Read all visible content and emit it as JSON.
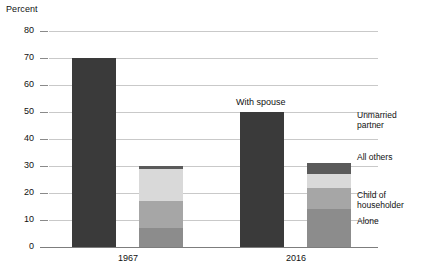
{
  "chart_data": {
    "type": "bar",
    "title": "",
    "subtitle": "",
    "ylabel": "Percent",
    "xlabel": "",
    "ylim": [
      0,
      80
    ],
    "ytick_values": [
      0,
      10,
      20,
      30,
      40,
      50,
      60,
      70,
      80
    ],
    "ytick_labels": [
      "0",
      "10",
      "20",
      "30",
      "40",
      "50",
      "60",
      "70",
      "80"
    ],
    "grid": true,
    "legend_position": "right-of-2016-stack",
    "categories": [
      "1967",
      "2016"
    ],
    "annotations": [
      {
        "text": "With spouse",
        "attached_to": "2016 with-spouse bar"
      }
    ],
    "series": [
      {
        "name": "With spouse",
        "color": "#3a3a3a",
        "values": [
          70,
          50
        ]
      },
      {
        "name": "Alone",
        "color": "#8c8c8c",
        "values": [
          7,
          14
        ]
      },
      {
        "name": "Child of householder",
        "color": "#a6a6a6",
        "values": [
          10,
          8
        ]
      },
      {
        "name": "All others",
        "color": "#d9d9d9",
        "values": [
          12,
          5
        ]
      },
      {
        "name": "Unmarried partner",
        "color": "#5a5a5a",
        "values": [
          1,
          4
        ]
      }
    ],
    "stack_totals": [
      30,
      31
    ]
  },
  "axis": {
    "y_title": "Percent",
    "ticks": [
      "80",
      "70",
      "60",
      "50",
      "40",
      "30",
      "20",
      "10",
      "0"
    ],
    "x_labels": [
      "1967",
      "2016"
    ]
  },
  "annotation": {
    "with_spouse": "With spouse"
  },
  "legend": {
    "items": [
      {
        "label": "Unmarried\npartner",
        "color": "#5a5a5a"
      },
      {
        "label": "All others",
        "color": "#d9d9d9"
      },
      {
        "label": "Child of\nhouseholder",
        "color": "#a6a6a6"
      },
      {
        "label": "Alone",
        "color": "#8c8c8c"
      }
    ]
  }
}
